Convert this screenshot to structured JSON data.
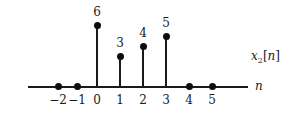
{
  "chart_data": {
    "type": "bar",
    "plot_style": "discrete-time stem plot",
    "title": "",
    "xlabel": "n",
    "ylabel": "x_2[n]",
    "ylabel_base": "x",
    "ylabel_sub": "2",
    "ylabel_bracket_open": "[",
    "ylabel_index": "n",
    "ylabel_bracket_close": "]",
    "grid": false,
    "legend": null,
    "xlim": [
      -2.6,
      5.8
    ],
    "ylim": [
      0,
      6.6
    ],
    "categories": [
      "-2",
      "-1",
      "0",
      "1",
      "2",
      "3",
      "4",
      "5"
    ],
    "x": [
      -2,
      -1,
      0,
      1,
      2,
      3,
      4,
      5
    ],
    "values": [
      0,
      0,
      6,
      3,
      4,
      5,
      0,
      0
    ],
    "tick_labels": [
      "−2",
      "−1",
      "0",
      "1",
      "2",
      "3",
      "4",
      "5"
    ],
    "value_labels": [
      "",
      "",
      "6",
      "3",
      "4",
      "5",
      "",
      ""
    ],
    "points": [
      {
        "n": "-2",
        "tick": "−2",
        "value": 0,
        "value_label": "",
        "x_px": 58,
        "top_px": 86,
        "has_stem": false
      },
      {
        "n": "-1",
        "tick": "−1",
        "value": 0,
        "value_label": "",
        "x_px": 77,
        "top_px": 86,
        "has_stem": false
      },
      {
        "n": "0",
        "tick": "0",
        "value": 6,
        "value_label": "6",
        "x_px": 97,
        "top_px": 25,
        "has_stem": true
      },
      {
        "n": "1",
        "tick": "1",
        "value": 3,
        "value_label": "3",
        "x_px": 120,
        "top_px": 56,
        "has_stem": true
      },
      {
        "n": "2",
        "tick": "2",
        "value": 4,
        "value_label": "4",
        "x_px": 143,
        "top_px": 46,
        "has_stem": true
      },
      {
        "n": "3",
        "tick": "3",
        "value": 5,
        "value_label": "5",
        "x_px": 166,
        "top_px": 36,
        "has_stem": true
      },
      {
        "n": "4",
        "tick": "4",
        "value": 0,
        "value_label": "",
        "x_px": 189,
        "top_px": 86,
        "has_stem": false
      },
      {
        "n": "5",
        "tick": "5",
        "value": 0,
        "value_label": "",
        "x_px": 212,
        "top_px": 86,
        "has_stem": false
      }
    ],
    "colors": {
      "line": "#1a1a1a",
      "marker": "#0d0d0d",
      "text": "#1a1a1a",
      "background": "#ffffff"
    },
    "axis": {
      "baseline_y_px": 86,
      "left_px": 28,
      "width_px": 220
    }
  }
}
